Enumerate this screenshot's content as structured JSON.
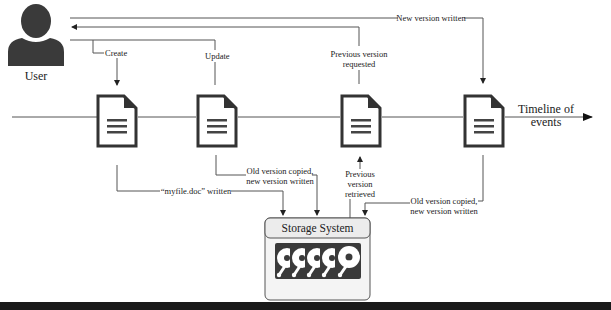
{
  "diagram": {
    "type": "versioning-timeline",
    "actor": {
      "label": "User",
      "icon": "user-icon"
    },
    "timeline": {
      "label_line1": "Timeline of",
      "label_line2": "events"
    },
    "documents": [
      {
        "id": "doc1",
        "icon": "document-icon"
      },
      {
        "id": "doc2",
        "icon": "document-icon"
      },
      {
        "id": "doc3",
        "icon": "document-icon"
      },
      {
        "id": "doc4",
        "icon": "document-icon"
      }
    ],
    "top_labels": {
      "create": "Create",
      "update": "Update",
      "previous_requested_line1": "Previous version",
      "previous_requested_line2": "requested",
      "new_version_written": "New version written"
    },
    "bottom_labels": {
      "myfile_written": "“myfile.doc” written",
      "old_copied_1_line1": "Old version copied,",
      "old_copied_1_line2": "new version written",
      "previous_retrieved_line1": "Previous",
      "previous_retrieved_line2": "version",
      "previous_retrieved_line3": "retrieved",
      "old_copied_2_line1": "Old version copied,",
      "old_copied_2_line2": "new version written"
    },
    "storage": {
      "title": "Storage System",
      "disk_count": 5,
      "disk_icon": "hard-disk-icon"
    },
    "colors": {
      "line": "#555555",
      "icon_dark": "#333333",
      "storage_bg": "#f2f2f2",
      "storage_border": "#555555"
    }
  }
}
